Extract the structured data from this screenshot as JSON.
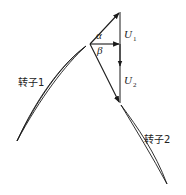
{
  "diagram": {
    "type": "velocity-triangle",
    "colors": {
      "stroke": "#1a1a1a",
      "background": "#ffffff"
    },
    "labels": {
      "alpha": "α",
      "beta": "β",
      "u1_main": "U",
      "u1_sub": "1",
      "u2_main": "U",
      "u2_sub": "2",
      "rotor1": "转子1",
      "rotor2": "转子2"
    },
    "points": {
      "apex_top": [
        120,
        12
      ],
      "left_vertex": [
        90,
        44
      ],
      "mid_right": [
        120,
        44
      ],
      "bottom_vertex": [
        120,
        103
      ]
    },
    "blades": [
      {
        "name": "转子1",
        "from": [
          86,
          46
        ],
        "to": [
          17,
          141
        ]
      },
      {
        "name": "转子2",
        "from": [
          121,
          105
        ],
        "to": [
          167,
          184
        ]
      }
    ]
  }
}
